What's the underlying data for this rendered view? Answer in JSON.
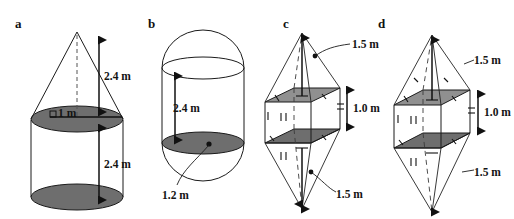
{
  "figure": {
    "background_color": "#ffffff",
    "ink_color": "#1a1a1a",
    "shade_color": "#6e6e6e",
    "shade_color_light": "#909090",
    "panels": [
      {
        "key": "a",
        "letter": "a",
        "shape_name": "cone-on-cylinder",
        "labels": [
          {
            "key": "radius",
            "text": "1 m",
            "role": "radius-label"
          },
          {
            "key": "cone_height",
            "text": "2.4 m",
            "role": "height-label"
          },
          {
            "key": "cylinder_height",
            "text": "2.4 m",
            "role": "height-label"
          }
        ]
      },
      {
        "key": "b",
        "letter": "b",
        "shape_name": "capsule-cylinder-with-hemispheres",
        "labels": [
          {
            "key": "cylinder_height",
            "text": "2.4 m",
            "role": "height-label"
          },
          {
            "key": "diameter",
            "text": "1.2 m",
            "role": "radius-label"
          }
        ]
      },
      {
        "key": "c",
        "letter": "c",
        "shape_name": "prism-with-two-pyramids",
        "labels": [
          {
            "key": "top_pyramid_height",
            "text": "1.5 m",
            "role": "height-label"
          },
          {
            "key": "prism_height",
            "text": "1.0 m",
            "role": "height-label"
          },
          {
            "key": "bottom_pyramid_height",
            "text": "1.5 m",
            "role": "height-label"
          }
        ]
      },
      {
        "key": "d",
        "letter": "d",
        "shape_name": "prism-with-two-pyramids",
        "labels": [
          {
            "key": "top_pyramid_height",
            "text": "1.5 m",
            "role": "height-label"
          },
          {
            "key": "prism_height",
            "text": "1.0 m",
            "role": "height-label"
          },
          {
            "key": "bottom_pyramid_height",
            "text": "1.5 m",
            "role": "height-label"
          }
        ]
      }
    ]
  }
}
